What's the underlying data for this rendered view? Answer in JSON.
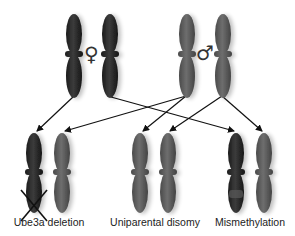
{
  "colors": {
    "maternal": "#2a2a2a",
    "paternal": "#5a5a5a",
    "arrow": "#111111",
    "background": "#ffffff"
  },
  "parents": {
    "female_symbol": "♀",
    "male_symbol": "♂"
  },
  "outcomes": [
    {
      "label": "Ube3a deletion",
      "x": 49
    },
    {
      "label": "Uniparental disomy",
      "x": 155
    },
    {
      "label": "Mismethylation",
      "x": 250
    }
  ]
}
